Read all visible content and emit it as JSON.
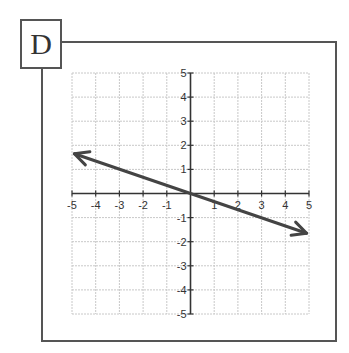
{
  "panel_label": "D",
  "chart_data": {
    "type": "line",
    "title": "",
    "xlabel": "",
    "ylabel": "",
    "xlim": [
      -5,
      5
    ],
    "ylim": [
      -5,
      5
    ],
    "grid": true,
    "x_ticks": [
      "-5",
      "-4",
      "-3",
      "-2",
      "-1",
      "1",
      "2",
      "3",
      "4",
      "5"
    ],
    "y_ticks": [
      "5",
      "4",
      "3",
      "2",
      "1",
      "-1",
      "-2",
      "-3",
      "-4",
      "-5"
    ],
    "series": [
      {
        "name": "line",
        "x": [
          -4.9,
          0,
          4.9
        ],
        "y": [
          1.65,
          0,
          -1.65
        ],
        "arrows": "both",
        "slope": -0.333,
        "intercept": 0
      }
    ]
  }
}
